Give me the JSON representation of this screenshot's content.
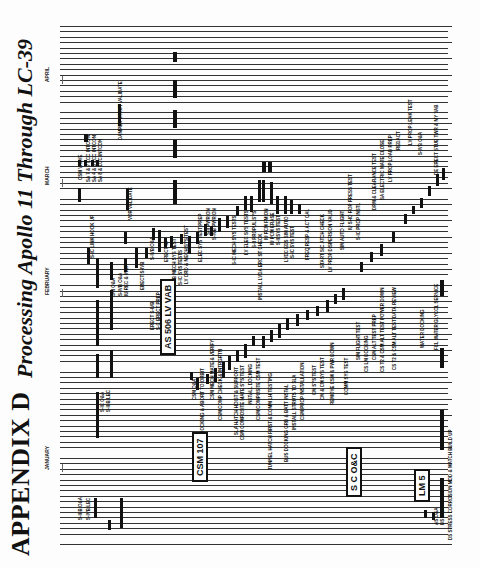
{
  "header": {
    "appendix": "APPENDIX D",
    "title": "Processing Apollo 11 Through LC-39"
  },
  "months": [
    {
      "label": "JANUARY",
      "x": 44,
      "y": 470
    },
    {
      "label": "FEBRUARY",
      "x": 44,
      "y": 295
    },
    {
      "label": "MARCH",
      "x": 44,
      "y": 185
    },
    {
      "label": "APRIL",
      "x": 44,
      "y": 82
    }
  ],
  "boxes": [
    {
      "label": "CSM 107",
      "x": 192,
      "y": 482
    },
    {
      "label": "AS 506 LV VAB",
      "x": 160,
      "y": 355
    },
    {
      "label": "S C O&C",
      "x": 346,
      "y": 497
    },
    {
      "label": "LM 5",
      "x": 414,
      "y": 502
    }
  ],
  "labels": [
    {
      "text": "S-II-B O&A",
      "x": 78,
      "y": 520
    },
    {
      "text": "S-IVB LEC",
      "x": 86,
      "y": 520
    },
    {
      "text": "S-IC O&A",
      "x": 100,
      "y": 412
    },
    {
      "text": "S-II-B LEC",
      "x": 106,
      "y": 412
    },
    {
      "text": "S-II O&A",
      "x": 111,
      "y": 296
    },
    {
      "text": "S-IVB O&A",
      "x": 118,
      "y": 296
    },
    {
      "text": "IU REC & INSP",
      "x": 124,
      "y": 296
    },
    {
      "text": "S-IC LINK HOOK UP",
      "x": 90,
      "y": 258
    },
    {
      "text": "CSM VALVE",
      "x": 78,
      "y": 180
    },
    {
      "text": "SA 7 & 7 LCC INTCON",
      "x": 86,
      "y": 182
    },
    {
      "text": "SA 4 & 5 LCC INTCON",
      "x": 92,
      "y": 182
    },
    {
      "text": "SA 8 & LCC INTCON",
      "x": 98,
      "y": 182
    },
    {
      "text": "DAMPER STRUT VALIDATE",
      "x": 118,
      "y": 140
    },
    {
      "text": "VOR VALIDATE",
      "x": 128,
      "y": 220
    },
    {
      "text": "ERECT S-IVB",
      "x": 140,
      "y": 290
    },
    {
      "text": "S-IVB O&A",
      "x": 150,
      "y": 260
    },
    {
      "text": "ERECT S-IVB",
      "x": 150,
      "y": 330
    },
    {
      "text": "S-C ERECT PREP",
      "x": 156,
      "y": 330
    },
    {
      "text": "ERECT IU",
      "x": 164,
      "y": 262
    },
    {
      "text": "S-IVB MECH SYS TEST",
      "x": 172,
      "y": 288
    },
    {
      "text": "S-IC SYS TESTS",
      "x": 178,
      "y": 285
    },
    {
      "text": "LV ORD & MECH SYS TEST",
      "x": 184,
      "y": 284
    },
    {
      "text": "ELEC SYS TEST PREP",
      "x": 198,
      "y": 262
    },
    {
      "text": "S-II PWR ON",
      "x": 206,
      "y": 235
    },
    {
      "text": "S-IVB PWR ON",
      "x": 212,
      "y": 240
    },
    {
      "text": "S-IC MECH SYS TESTS",
      "x": 232,
      "y": 265
    },
    {
      "text": "LV ELEC SYS TESTS",
      "x": 244,
      "y": 255
    },
    {
      "text": "S-II PROPUL SYS",
      "x": 252,
      "y": 248
    },
    {
      "text": "INSTALL LVDA ERC ST CHECK",
      "x": 258,
      "y": 300
    },
    {
      "text": "IU PCM FM ON",
      "x": 264,
      "y": 240
    },
    {
      "text": "IU PCM ERASE",
      "x": 270,
      "y": 245
    },
    {
      "text": "S-II SYS TEST",
      "x": 276,
      "y": 245
    },
    {
      "text": "LVDC EDS SIM AUTO",
      "x": 284,
      "y": 262
    },
    {
      "text": "S-IC SYS TEST",
      "x": 290,
      "y": 258
    },
    {
      "text": "FREQ RESP & ACT CAL",
      "x": 305,
      "y": 260
    },
    {
      "text": "START S/C ATCH CHECK",
      "x": 320,
      "y": 268
    },
    {
      "text": "LV PROP DISPERSION VALID",
      "x": 328,
      "y": 272
    },
    {
      "text": "SIM AUTO FLIGHT",
      "x": 340,
      "y": 250
    },
    {
      "text": "IU SHO ROP PRESS TEST",
      "x": 348,
      "y": 230
    },
    {
      "text": "S-IC PROP INSTL",
      "x": 356,
      "y": 240
    },
    {
      "text": "DPM & CLEARANCE TEST",
      "x": 372,
      "y": 210
    },
    {
      "text": "SA ELECTRIC MATE CLOSE",
      "x": 380,
      "y": 200
    },
    {
      "text": "LV PROP LOAD PREP",
      "x": 388,
      "y": 182
    },
    {
      "text": "REDACT",
      "x": 396,
      "y": 150
    },
    {
      "text": "LV PROP LEAK TEST",
      "x": 408,
      "y": 145
    },
    {
      "text": "S-IVB O&A",
      "x": 418,
      "y": 155
    },
    {
      "text": "DE ERECT STUB TWR & MY VAB",
      "x": 434,
      "y": 175
    },
    {
      "text": "CSM O&A",
      "x": 192,
      "y": 400
    },
    {
      "text": "CSM DOCKING & ABORT TO ORBIT",
      "x": 200,
      "y": 445
    },
    {
      "text": "CSM MECH MATE & VERIFY",
      "x": 210,
      "y": 400
    },
    {
      "text": "CSM COMP CHECK & INTRGRTN",
      "x": 218,
      "y": 420
    },
    {
      "text": "SLA HATCH HOIST & SUPPORT",
      "x": 234,
      "y": 435
    },
    {
      "text": "CSM COMPOSITE MATE SYS TEST",
      "x": 240,
      "y": 440
    },
    {
      "text": "INSTALL DOCKING",
      "x": 248,
      "y": 405
    },
    {
      "text": "CSM COMPOSITE CSM TEST",
      "x": 256,
      "y": 420
    },
    {
      "text": "TUNNEL HATCH FIRST & COMM LH TESTING",
      "x": 268,
      "y": 470
    },
    {
      "text": "BUS DOCKING GRD & BATT INSTAL",
      "x": 284,
      "y": 462
    },
    {
      "text": "INSTALL STRUTS TO SLA",
      "x": 292,
      "y": 430
    },
    {
      "text": "CSM PROP INSTALLATION",
      "x": 300,
      "y": 420
    },
    {
      "text": "CM SYS TEST",
      "x": 312,
      "y": 395
    },
    {
      "text": "CM & CM SYS TEST",
      "x": 320,
      "y": 400
    },
    {
      "text": "REMOVE CSM & PWR DOWN",
      "x": 330,
      "y": 405
    },
    {
      "text": "COMM SYS TEST",
      "x": 344,
      "y": 395
    },
    {
      "text": "SIM FLIGHT TEST",
      "x": 356,
      "y": 360
    },
    {
      "text": "CS LM DOCKING",
      "x": 364,
      "y": 372
    },
    {
      "text": "CSM ALT TEST PREP",
      "x": 372,
      "y": 360
    },
    {
      "text": "CS T2 & CSM ALT TEST POWER DOWN",
      "x": 380,
      "y": 372
    },
    {
      "text": "CS T2 & CSM ALT TEST DATA REVIEW",
      "x": 392,
      "y": 370
    },
    {
      "text": "WATER DOCKING",
      "x": 420,
      "y": 348
    },
    {
      "text": "FCL WATER GLYCOL SERVICE",
      "x": 434,
      "y": 350
    },
    {
      "text": "AS O&A",
      "x": 434,
      "y": 525
    },
    {
      "text": "DS O&A",
      "x": 440,
      "y": 525
    },
    {
      "text": "DS STRESS CORROSION MOD & MATCH BUILD UP",
      "x": 448,
      "y": 540
    }
  ],
  "chart_data": {
    "type": "gantt",
    "title": "Processing Apollo 11 Through LC-39",
    "subtitle": "Appendix D",
    "orientation": "rotated -90deg (time runs bottom to top)",
    "time_axis": [
      "JANUARY",
      "FEBRUARY",
      "MARCH",
      "APRIL"
    ],
    "groups": [
      {
        "name": "AS 506 LV VAB",
        "tasks": [
          "S-IC O&A",
          "S-II O&A",
          "S-IVB O&A",
          "IU REC & INSP",
          "ERECT S-IVB",
          "ERECT IU",
          "LV ELEC SYS TESTS",
          "LV PROP LEAK TEST",
          "DE ERECT STUB TWR & MV VAB"
        ]
      },
      {
        "name": "CSM 107",
        "tasks": [
          "CSM O&A",
          "CSM DOCKING & ABORT TO ORBIT",
          "CSM MECH MATE & VERIFY",
          "CM SYS TEST",
          "COMM SYS TEST",
          "CSM ALT TEST PREP"
        ]
      },
      {
        "name": "S C O&C",
        "tasks": [
          "SIM FLIGHT TEST",
          "WATER DOCKING",
          "FCL WATER GLYCOL SERVICE"
        ]
      },
      {
        "name": "LM 5",
        "tasks": [
          "AS O&A",
          "DS O&A",
          "DS STRESS CORROSION MOD & MATCH BUILD UP"
        ]
      }
    ]
  }
}
